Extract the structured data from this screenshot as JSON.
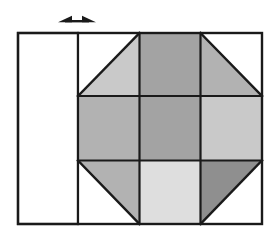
{
  "figure": {
    "title": "Octagon tiling grid with dimension arrow",
    "canvas": {
      "width": 274,
      "height": 237,
      "background": "#ffffff"
    },
    "stroke": {
      "color": "#1a1a1a",
      "width": 2.2
    },
    "palette": {
      "white": "#ffffff",
      "light": "#c9c9c9",
      "light_extra": "#dedede",
      "medium": "#b2b2b2",
      "medium_dark": "#a3a3a3",
      "dark": "#8f8f8f"
    },
    "outer_frame": {
      "label": "outer rectangle",
      "x": 18,
      "y": 33,
      "width": 244,
      "height": 191
    },
    "left_panel": {
      "label": "blank left panel",
      "x": 18,
      "y": 33,
      "width": 60,
      "height": 191,
      "fill": "#ffffff"
    },
    "grid": {
      "label": "three by three grid",
      "x": 78,
      "y": 33,
      "width": 184,
      "height": 191,
      "columns": 3,
      "rows": 3,
      "x_lines": [
        78,
        139.5,
        200.5,
        262
      ],
      "y_lines": [
        33,
        96,
        160.5,
        224
      ]
    },
    "cells": [
      {
        "name": "cell-top-left",
        "row": 0,
        "column": 0,
        "shape": "triangle",
        "orientation": "lower-right",
        "fill": "#c9c9c9"
      },
      {
        "name": "cell-top-center",
        "row": 0,
        "column": 1,
        "shape": "square",
        "orientation": "full",
        "fill": "#a3a3a3"
      },
      {
        "name": "cell-top-right",
        "row": 0,
        "column": 2,
        "shape": "triangle",
        "orientation": "lower-left",
        "fill": "#b2b2b2"
      },
      {
        "name": "cell-middle-left",
        "row": 1,
        "column": 0,
        "shape": "square",
        "orientation": "full",
        "fill": "#b2b2b2"
      },
      {
        "name": "cell-middle-center",
        "row": 1,
        "column": 1,
        "shape": "square",
        "orientation": "full",
        "fill": "#a3a3a3"
      },
      {
        "name": "cell-middle-right",
        "row": 1,
        "column": 2,
        "shape": "square",
        "orientation": "full",
        "fill": "#c9c9c9"
      },
      {
        "name": "cell-bottom-left",
        "row": 2,
        "column": 0,
        "shape": "triangle",
        "orientation": "upper-right",
        "fill": "#b2b2b2"
      },
      {
        "name": "cell-bottom-center",
        "row": 2,
        "column": 1,
        "shape": "square",
        "orientation": "full",
        "fill": "#dedede"
      },
      {
        "name": "cell-bottom-right",
        "row": 2,
        "column": 2,
        "shape": "triangle",
        "orientation": "upper-left",
        "fill": "#8f8f8f"
      }
    ],
    "dimension_arrow": {
      "name": "double-headed-arrow",
      "label": "",
      "orientation": "horizontal",
      "x_start": 58,
      "x_end": 96,
      "y": 21,
      "fill": "#1a1a1a"
    }
  }
}
